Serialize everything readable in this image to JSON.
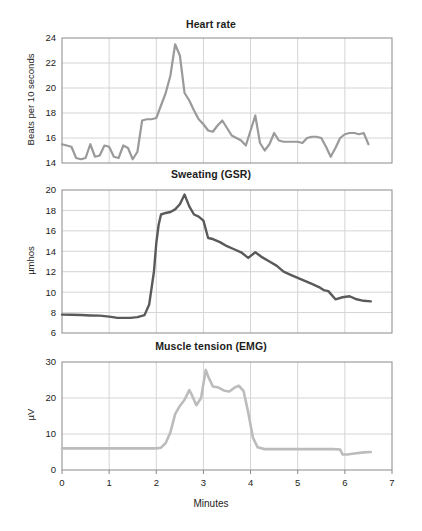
{
  "figure": {
    "caption_axis_label": "Minutes",
    "background": "#ffffff"
  },
  "chart_data": [
    {
      "id": "heart-rate",
      "type": "line",
      "title": "Heart rate",
      "xlabel": "",
      "ylabel": "Beats per 10 seconds",
      "xlim": [
        0,
        7
      ],
      "ylim": [
        14,
        24
      ],
      "xticks": [
        0,
        1,
        2,
        3,
        4,
        5,
        6,
        7
      ],
      "yticks": [
        14,
        16,
        18,
        20,
        22,
        24
      ],
      "xtick_labels_visible": false,
      "grid": true,
      "line_color": "#9a9a9a",
      "line_width": 2.2,
      "x": [
        0.0,
        0.1,
        0.2,
        0.3,
        0.4,
        0.5,
        0.6,
        0.7,
        0.8,
        0.9,
        1.0,
        1.1,
        1.2,
        1.3,
        1.4,
        1.5,
        1.6,
        1.7,
        1.8,
        1.9,
        2.0,
        2.1,
        2.2,
        2.3,
        2.4,
        2.5,
        2.6,
        2.7,
        2.8,
        2.9,
        3.0,
        3.1,
        3.2,
        3.3,
        3.4,
        3.5,
        3.6,
        3.7,
        3.8,
        3.9,
        4.0,
        4.1,
        4.2,
        4.3,
        4.4,
        4.5,
        4.6,
        4.7,
        4.8,
        4.9,
        5.0,
        5.1,
        5.2,
        5.3,
        5.4,
        5.5,
        5.6,
        5.7,
        5.8,
        5.9,
        6.0,
        6.1,
        6.2,
        6.3,
        6.4,
        6.5
      ],
      "y": [
        15.5,
        15.4,
        15.3,
        14.4,
        14.3,
        14.4,
        15.5,
        14.5,
        14.6,
        15.4,
        15.3,
        14.5,
        14.4,
        15.4,
        15.2,
        14.3,
        14.9,
        17.4,
        17.5,
        17.5,
        17.6,
        18.6,
        19.6,
        21.0,
        23.5,
        22.6,
        19.6,
        19.0,
        18.2,
        17.5,
        17.1,
        16.6,
        16.5,
        17.0,
        17.4,
        16.8,
        16.2,
        16.0,
        15.8,
        15.4,
        16.6,
        17.8,
        15.6,
        15.0,
        15.5,
        16.4,
        15.8,
        15.7,
        15.7,
        15.7,
        15.7,
        15.6,
        16.0,
        16.1,
        16.1,
        16.0,
        15.3,
        14.5,
        15.2,
        16.0,
        16.3,
        16.4,
        16.4,
        16.3,
        16.4,
        15.5
      ]
    },
    {
      "id": "sweating-gsr",
      "type": "line",
      "title": "Sweating (GSR)",
      "xlabel": "",
      "ylabel": "µmhos",
      "xlim": [
        0,
        7
      ],
      "ylim": [
        6,
        20
      ],
      "xticks": [
        0,
        1,
        2,
        3,
        4,
        5,
        6,
        7
      ],
      "yticks": [
        6,
        8,
        10,
        12,
        14,
        16,
        18,
        20
      ],
      "xtick_labels_visible": false,
      "grid": true,
      "line_color": "#5a5a5a",
      "line_width": 2.4,
      "x": [
        0.0,
        0.2,
        0.4,
        0.6,
        0.8,
        1.0,
        1.15,
        1.3,
        1.45,
        1.6,
        1.75,
        1.85,
        1.95,
        2.0,
        2.05,
        2.1,
        2.2,
        2.3,
        2.4,
        2.5,
        2.6,
        2.7,
        2.8,
        2.9,
        3.0,
        3.1,
        3.2,
        3.35,
        3.5,
        3.65,
        3.8,
        3.95,
        4.1,
        4.25,
        4.4,
        4.55,
        4.7,
        4.85,
        5.0,
        5.15,
        5.3,
        5.45,
        5.55,
        5.65,
        5.8,
        5.95,
        6.1,
        6.25,
        6.4,
        6.55
      ],
      "y": [
        7.8,
        7.78,
        7.76,
        7.72,
        7.7,
        7.6,
        7.5,
        7.48,
        7.48,
        7.55,
        7.75,
        8.8,
        12.0,
        14.8,
        16.6,
        17.6,
        17.75,
        17.85,
        18.1,
        18.6,
        19.55,
        18.4,
        17.6,
        17.4,
        17.0,
        15.3,
        15.2,
        14.9,
        14.5,
        14.2,
        13.9,
        13.35,
        13.9,
        13.4,
        13.0,
        12.6,
        12.0,
        11.7,
        11.4,
        11.1,
        10.8,
        10.5,
        10.2,
        10.1,
        9.3,
        9.5,
        9.6,
        9.3,
        9.15,
        9.1
      ]
    },
    {
      "id": "muscle-tension-emg",
      "type": "line",
      "title": "Muscle tension (EMG)",
      "xlabel": "Minutes",
      "ylabel": "µV",
      "xlim": [
        0,
        7
      ],
      "ylim": [
        0,
        30
      ],
      "xticks": [
        0,
        1,
        2,
        3,
        4,
        5,
        6,
        7
      ],
      "yticks": [
        0,
        10,
        20,
        30
      ],
      "xtick_labels_visible": true,
      "grid": true,
      "line_color": "#bcbcbc",
      "line_width": 2.6,
      "x": [
        0.0,
        0.3,
        0.6,
        0.9,
        1.2,
        1.5,
        1.8,
        2.0,
        2.1,
        2.2,
        2.3,
        2.4,
        2.5,
        2.6,
        2.7,
        2.75,
        2.85,
        2.95,
        3.0,
        3.05,
        3.1,
        3.2,
        3.3,
        3.45,
        3.55,
        3.65,
        3.75,
        3.85,
        3.95,
        4.05,
        4.15,
        4.3,
        4.6,
        5.0,
        5.4,
        5.75,
        5.9,
        5.95,
        6.05,
        6.2,
        6.4,
        6.55
      ],
      "y": [
        6.0,
        6.0,
        6.0,
        6.0,
        6.0,
        6.0,
        6.0,
        6.0,
        6.2,
        7.5,
        10.5,
        15.5,
        17.8,
        19.5,
        22.2,
        21.0,
        18.0,
        20.0,
        24.0,
        27.8,
        26.0,
        23.2,
        23.0,
        22.0,
        21.8,
        22.8,
        23.4,
        22.0,
        16.0,
        9.0,
        6.3,
        5.8,
        5.8,
        5.8,
        5.8,
        5.8,
        5.7,
        4.3,
        4.3,
        4.6,
        4.9,
        5.0
      ]
    }
  ]
}
